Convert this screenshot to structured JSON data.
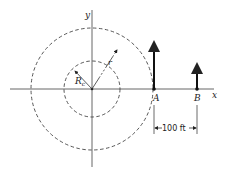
{
  "diagram": {
    "axes": {
      "x_label": "x",
      "y_label": "y"
    },
    "inner_circle": {
      "radius_label": "R",
      "radius_subscript": "c"
    },
    "outer_circle": {
      "radius_label": "r"
    },
    "points": [
      {
        "label": "A"
      },
      {
        "label": "B"
      }
    ],
    "dimension": {
      "label": "100 ft"
    },
    "colors": {
      "line": "#222222",
      "axis": "#555555"
    }
  }
}
